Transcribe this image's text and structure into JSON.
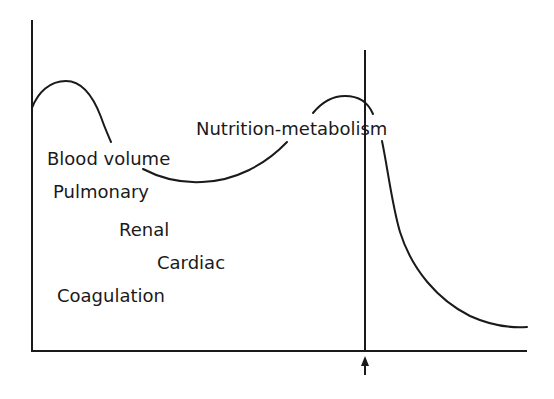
{
  "diagram": {
    "type": "conceptual-curve",
    "labels": {
      "peak_label": "Nutrition-metabolism",
      "list": [
        "Blood volume",
        "Pulmonary",
        "Renal",
        "Cardiac",
        "Coagulation"
      ]
    },
    "marker": {
      "icon": "up-arrow-icon"
    },
    "colors": {
      "ink": "#1a1a1a",
      "background": "#ffffff"
    }
  }
}
